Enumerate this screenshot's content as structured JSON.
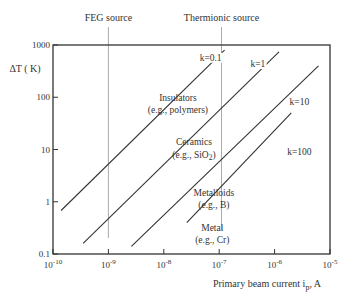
{
  "chart_data": {
    "type": "line",
    "title": "",
    "xlabel": "Primary beam current i_p, A",
    "xlabel_main": "Primary beam current i",
    "xlabel_sub": "p",
    "xlabel_tail": ", A",
    "ylabel": "ΔT ( K)",
    "xscale": "log",
    "yscale": "log",
    "xlim": [
      1e-10,
      1e-05
    ],
    "ylim": [
      0.1,
      1000
    ],
    "grid": false,
    "x_ticks": [
      {
        "value": 1e-10,
        "mant": "10",
        "exp": "-10"
      },
      {
        "value": 1e-09,
        "mant": "10",
        "exp": "-9"
      },
      {
        "value": 1e-08,
        "mant": "10",
        "exp": "-8"
      },
      {
        "value": 1e-07,
        "mant": "10",
        "exp": "-7"
      },
      {
        "value": 1e-06,
        "mant": "10",
        "exp": "-6"
      },
      {
        "value": 1e-05,
        "mant": "10",
        "exp": "-5"
      }
    ],
    "y_ticks": [
      {
        "value": 0.1,
        "label": "0.1"
      },
      {
        "value": 1,
        "label": "1"
      },
      {
        "value": 10,
        "label": "10"
      },
      {
        "value": 100,
        "label": "100"
      },
      {
        "value": 1000,
        "label": "1000"
      }
    ],
    "series": [
      {
        "name": "k=0.1",
        "material": "Insulators",
        "example": "(e.g., polymers)",
        "x": [
          1.4e-10,
          1.25e-07
        ],
        "y": [
          0.68,
          800
        ]
      },
      {
        "name": "k=1",
        "material": "Ceramics",
        "example": "(e.g., SiO2)",
        "x": [
          3.5e-10,
          1.2e-06
        ],
        "y": [
          0.16,
          740
        ]
      },
      {
        "name": "k=10",
        "material": "Metalloids",
        "example": "(e.g., B)",
        "x": [
          2.6e-09,
          6.2e-06
        ],
        "y": [
          0.14,
          400
        ]
      },
      {
        "name": "k=100",
        "material": "Metal",
        "example": "(e.g., Cr)",
        "x": [
          2.6e-08,
          2e-06
        ],
        "y": [
          0.4,
          50
        ]
      }
    ],
    "vertical_markers": [
      {
        "label": "FEG source",
        "x": 1e-09
      },
      {
        "label": "Thermionic source",
        "x": 1.1e-07
      }
    ],
    "annotations": [
      {
        "text": "k=0.1",
        "x": 7e-08,
        "y": 500
      },
      {
        "text": "k=1",
        "x": 5e-07,
        "y": 380
      },
      {
        "text": "k=10",
        "x": 2.8e-06,
        "y": 70
      },
      {
        "text": "k=100",
        "x": 2.8e-06,
        "y": 8
      },
      {
        "text": "Insulators",
        "x": 1.8e-08,
        "y": 85
      },
      {
        "text": "(e.g., polymers)",
        "x": 1.8e-08,
        "y": 50
      },
      {
        "text": "Ceramics",
        "x": 3.5e-08,
        "y": 12
      },
      {
        "text": "(e.g., SiO2)",
        "x": 3.5e-08,
        "y": 7
      },
      {
        "text": "Metalloids",
        "x": 8e-08,
        "y": 1.3
      },
      {
        "text": "(e.g., B)",
        "x": 8e-08,
        "y": 0.75
      },
      {
        "text": "Metal",
        "x": 7.5e-08,
        "y": 0.27
      },
      {
        "text": "(e.g., Cr)",
        "x": 7.5e-08,
        "y": 0.16
      }
    ]
  },
  "colors": {
    "axis": "#333333",
    "line": "#333333",
    "marker": "#aaaaaa",
    "text": "#333333"
  }
}
